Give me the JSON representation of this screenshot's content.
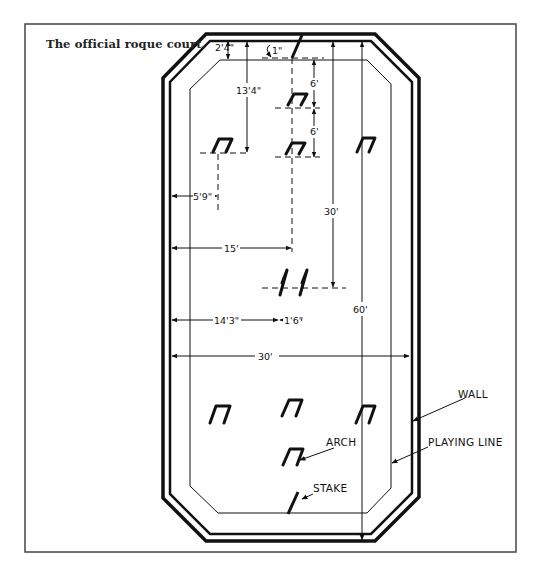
{
  "caption": "The official roque court.",
  "colors": {
    "ink": "#111111",
    "frame": "#444444",
    "background": "#ffffff"
  },
  "labels": {
    "wall": "WALL",
    "playing_line": "PLAYING LINE",
    "arch": "ARCH",
    "stake": "STAKE"
  },
  "dimensions": {
    "corner_offset": "2'4\"",
    "stake_offset": "1\"",
    "arch_spacing_1": "6'",
    "arch_spacing_2": "6'",
    "corner_arch_depth": "13'4\"",
    "corner_arch_side": "5'9\"",
    "half_length": "30'",
    "half_width": "15'",
    "cage_offset": "14'3\"",
    "cage_width": "1'6\"",
    "full_width": "30'",
    "full_length": "60'"
  },
  "court": {
    "elements": [
      "outer wall",
      "inner wall",
      "playing line",
      "10 arches",
      "2 stakes",
      "center cage"
    ]
  }
}
